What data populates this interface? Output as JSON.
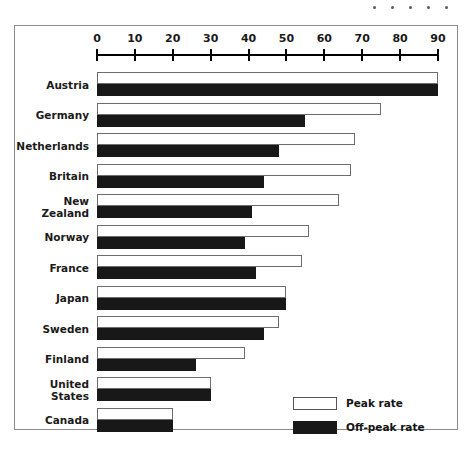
{
  "decor": {
    "dots_count": 5,
    "dot_color": "#58585a"
  },
  "legend": {
    "position": "bottom-right",
    "entries": [
      {
        "label": "Peak rate",
        "style": "outlined-white",
        "color": "#ffffff"
      },
      {
        "label": "Off-peak rate",
        "style": "solid-black",
        "color": "#181818"
      }
    ]
  },
  "chart_data": {
    "type": "bar",
    "orientation": "horizontal",
    "title": "",
    "subtitle": "",
    "xlabel": "",
    "ylabel": "",
    "xlim": [
      0,
      90
    ],
    "grid": false,
    "legend_position": "bottom-right",
    "xticks": [
      0,
      10,
      20,
      30,
      40,
      50,
      60,
      70,
      80,
      90
    ],
    "xtick_labels": [
      "0",
      "10",
      "20",
      "30",
      "40",
      "50",
      "60",
      "70",
      "80",
      "90"
    ],
    "categories": [
      "Austria",
      "Germany",
      "Netherlands",
      "Britain",
      "New Zealand",
      "Norway",
      "France",
      "Japan",
      "Sweden",
      "Finland",
      "United States",
      "Canada"
    ],
    "category_label_lines": [
      [
        "Austria"
      ],
      [
        "Germany"
      ],
      [
        "Netherlands"
      ],
      [
        "Britain"
      ],
      [
        "New",
        "Zealand"
      ],
      [
        "Norway"
      ],
      [
        "France"
      ],
      [
        "Japan"
      ],
      [
        "Sweden"
      ],
      [
        "Finland"
      ],
      [
        "United",
        "States"
      ],
      [
        "Canada"
      ]
    ],
    "series": [
      {
        "name": "Peak rate",
        "color": "#ffffff",
        "values": [
          90,
          75,
          68,
          67,
          64,
          56,
          54,
          50,
          48,
          39,
          30,
          20
        ]
      },
      {
        "name": "Off-peak rate",
        "color": "#181818",
        "values": [
          90,
          55,
          48,
          44,
          41,
          39,
          42,
          50,
          44,
          26,
          30,
          20
        ]
      }
    ]
  }
}
